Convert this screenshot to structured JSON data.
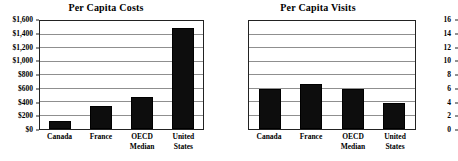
{
  "chart_data": [
    {
      "type": "bar",
      "title": "Per Capita Costs",
      "xlabel": "",
      "ylabel": "",
      "categories": [
        "Canada",
        "France",
        "OECD\nMedian",
        "United\nStates"
      ],
      "values": [
        120,
        340,
        470,
        1490
      ],
      "ylim": [
        0,
        1600
      ],
      "yticks": [
        0,
        200,
        400,
        600,
        800,
        1000,
        1200,
        1400,
        1600
      ],
      "ytick_labels": [
        "$0",
        "$200",
        "$400",
        "$600",
        "$800",
        "$1,000",
        "$1,200",
        "$1,400",
        "$1,600"
      ],
      "grid": true,
      "legend": "none",
      "bar_color": "#0d0d0d",
      "axis_color": "#222222",
      "gridline_color": "#8f8f8f"
    },
    {
      "type": "bar",
      "title": "Per Capita Visits",
      "xlabel": "",
      "ylabel": "",
      "categories": [
        "Canada",
        "France",
        "OECD\nMedian",
        "United\nStates"
      ],
      "values": [
        6.0,
        6.6,
        6.0,
        3.8
      ],
      "ylim": [
        0,
        16
      ],
      "yticks": [
        0,
        2,
        4,
        6,
        8,
        10,
        12,
        14,
        16
      ],
      "ytick_labels": [
        "0",
        "2",
        "4",
        "6",
        "8",
        "10",
        "12",
        "14",
        "16"
      ],
      "grid": true,
      "legend": "none",
      "bar_color": "#0d0d0d",
      "axis_color": "#222222",
      "gridline_color": "#8f8f8f"
    }
  ]
}
